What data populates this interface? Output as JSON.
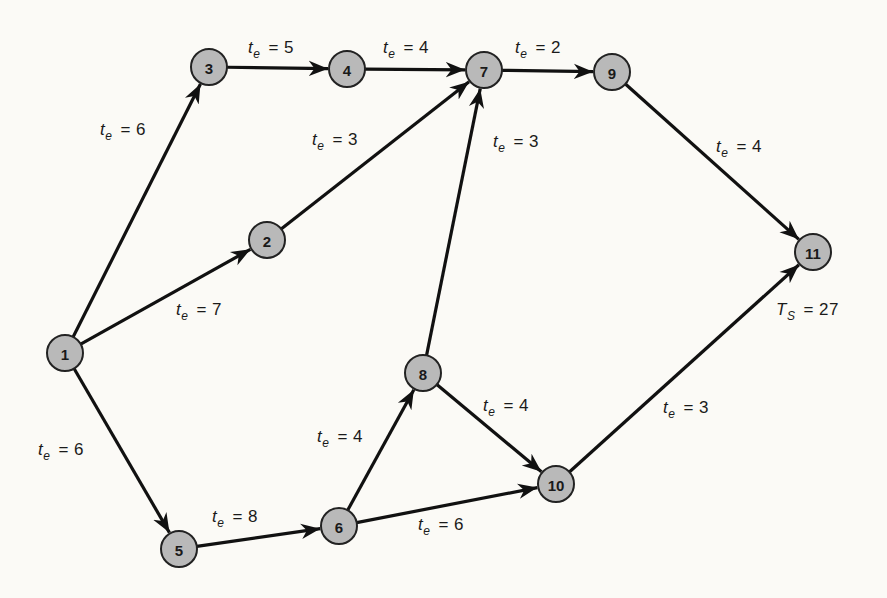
{
  "diagram": {
    "type": "PERT network",
    "background": "#fbfaf6",
    "node_fill": "#b9b9b9",
    "nodes": [
      {
        "id": "1",
        "x": 65,
        "y": 353
      },
      {
        "id": "2",
        "x": 267,
        "y": 240
      },
      {
        "id": "3",
        "x": 209,
        "y": 67
      },
      {
        "id": "4",
        "x": 347,
        "y": 69
      },
      {
        "id": "5",
        "x": 179,
        "y": 549
      },
      {
        "id": "6",
        "x": 339,
        "y": 526
      },
      {
        "id": "7",
        "x": 484,
        "y": 70
      },
      {
        "id": "8",
        "x": 423,
        "y": 373
      },
      {
        "id": "9",
        "x": 612,
        "y": 72
      },
      {
        "id": "10",
        "x": 556,
        "y": 484
      },
      {
        "id": "11",
        "x": 813,
        "y": 252
      }
    ],
    "edges": [
      {
        "from": "1",
        "to": "3",
        "label_var": "t",
        "label_sub": "e",
        "value": "= 6",
        "lx": 100,
        "ly": 120
      },
      {
        "from": "1",
        "to": "2",
        "label_var": "t",
        "label_sub": "e",
        "value": "= 7",
        "lx": 176,
        "ly": 300
      },
      {
        "from": "1",
        "to": "5",
        "label_var": "t",
        "label_sub": "e",
        "value": "= 6",
        "lx": 38,
        "ly": 440
      },
      {
        "from": "3",
        "to": "4",
        "label_var": "t",
        "label_sub": "e",
        "value": "= 5",
        "lx": 248,
        "ly": 38
      },
      {
        "from": "4",
        "to": "7",
        "label_var": "t",
        "label_sub": "e",
        "value": "= 4",
        "lx": 383,
        "ly": 38
      },
      {
        "from": "2",
        "to": "7",
        "label_var": "t",
        "label_sub": "e",
        "value": "= 3",
        "lx": 312,
        "ly": 130
      },
      {
        "from": "7",
        "to": "9",
        "label_var": "t",
        "label_sub": "e",
        "value": "= 2",
        "lx": 515,
        "ly": 38
      },
      {
        "from": "8",
        "to": "7",
        "label_var": "t",
        "label_sub": "e",
        "value": "= 3",
        "lx": 493,
        "ly": 132
      },
      {
        "from": "9",
        "to": "11",
        "label_var": "t",
        "label_sub": "e",
        "value": "= 4",
        "lx": 716,
        "ly": 137
      },
      {
        "from": "5",
        "to": "6",
        "label_var": "t",
        "label_sub": "e",
        "value": "= 8",
        "lx": 212,
        "ly": 507
      },
      {
        "from": "6",
        "to": "8",
        "label_var": "t",
        "label_sub": "e",
        "value": "= 4",
        "lx": 317,
        "ly": 427
      },
      {
        "from": "6",
        "to": "10",
        "label_var": "t",
        "label_sub": "e",
        "value": "= 6",
        "lx": 418,
        "ly": 515
      },
      {
        "from": "8",
        "to": "10",
        "label_var": "t",
        "label_sub": "e",
        "value": "= 4",
        "lx": 483,
        "ly": 396
      },
      {
        "from": "10",
        "to": "11",
        "label_var": "t",
        "label_sub": "e",
        "value": "= 3",
        "lx": 663,
        "ly": 398
      }
    ],
    "annotation": {
      "var": "T",
      "sub": "S",
      "value": "= 27",
      "lx": 776,
      "ly": 300
    }
  }
}
